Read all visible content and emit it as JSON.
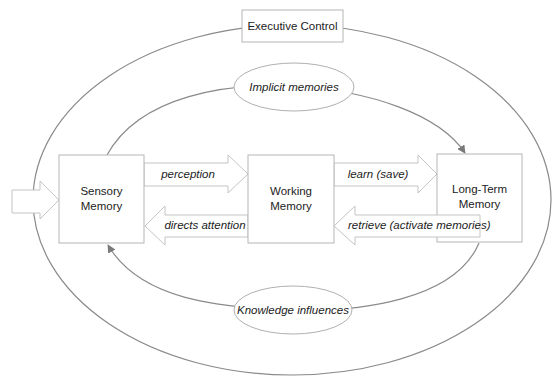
{
  "diagram": {
    "executive_control": {
      "label": "Executive Control"
    },
    "implicit_memories": {
      "label": "Implicit memories"
    },
    "knowledge_influences": {
      "label": "Knowledge influences"
    },
    "nodes": {
      "sensory": {
        "line1": "Sensory",
        "line2": "Memory"
      },
      "working": {
        "line1": "Working",
        "line2": "Memory"
      },
      "long_term": {
        "line1": "Long-Term",
        "line2": "Memory"
      }
    },
    "arrows": {
      "perception": "perception",
      "directs_attention": "directs attention",
      "learn": "learn (save)",
      "retrieve": "retrieve (activate memories)"
    },
    "colors": {
      "line": "#8a8a8a",
      "box_border": "#b5b5b5",
      "arrow_border": "#c4c4c4",
      "text": "#222222"
    }
  }
}
